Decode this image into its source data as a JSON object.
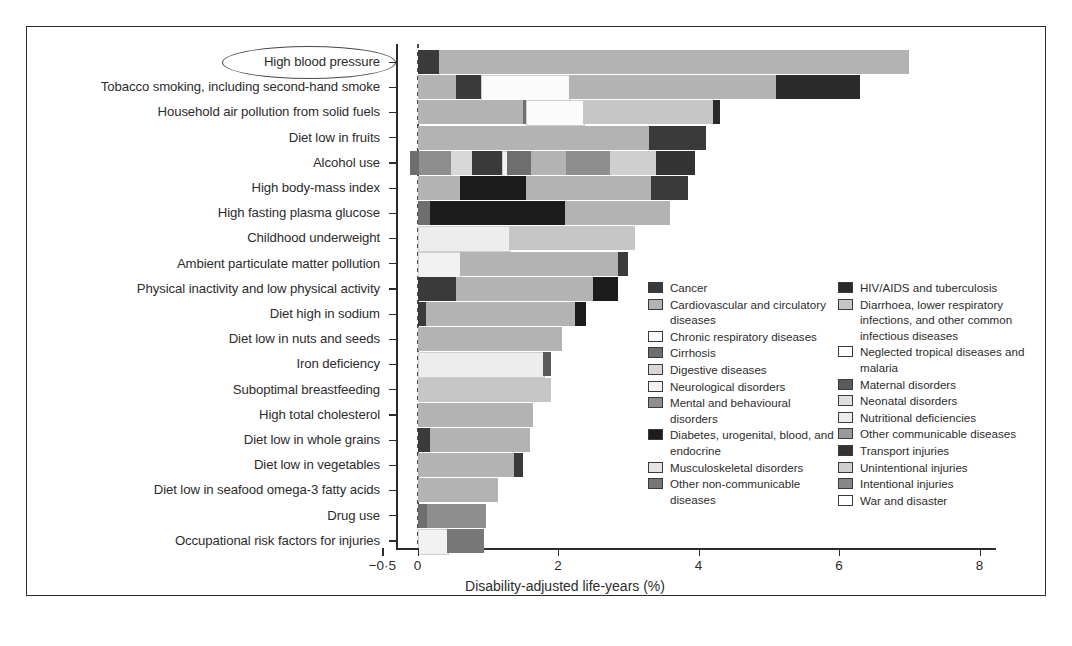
{
  "figure": {
    "xlabel": "Disability-adjusted life-years (%)",
    "x_ticks": [
      "−0·5",
      "0",
      "2",
      "4",
      "6",
      "8"
    ],
    "highlight": "High blood pressure"
  },
  "palette": {
    "cancer": "#3a3a3a",
    "cardiovascular": "#b3b3b3",
    "chronic_respiratory": "#fbfbfb",
    "cirrhosis": "#6e6e6e",
    "digestive": "#d8d8d8",
    "neurological": "#f2f2f2",
    "mental_behavioural": "#8e8e8e",
    "diabetes": "#1c1c1c",
    "musculoskeletal": "#e4e4e4",
    "other_noncommunicable": "#777777",
    "hiv_tb": "#2a2a2a",
    "diarrhoea": "#c6c6c6",
    "neglected_tropical": "#fdfdfd",
    "maternal": "#5a5a5a",
    "neonatal": "#e0e0e0",
    "nutritional": "#ededed",
    "other_communicable": "#9a9a9a",
    "transport": "#333333",
    "unintentional": "#cfcfcf",
    "intentional": "#878787",
    "war_disaster": "#ffffff"
  },
  "legend": {
    "left": [
      {
        "key": "cancer",
        "label": "Cancer"
      },
      {
        "key": "cardiovascular",
        "label": "Cardiovascular and circulatory diseases"
      },
      {
        "key": "chronic_respiratory",
        "label": "Chronic respiratory diseases"
      },
      {
        "key": "cirrhosis",
        "label": "Cirrhosis"
      },
      {
        "key": "digestive",
        "label": "Digestive diseases"
      },
      {
        "key": "neurological",
        "label": "Neurological disorders"
      },
      {
        "key": "mental_behavioural",
        "label": "Mental and behavioural disorders"
      },
      {
        "key": "diabetes",
        "label": "Diabetes, urogenital, blood, and endocrine"
      },
      {
        "key": "musculoskeletal",
        "label": "Musculoskeletal disorders"
      },
      {
        "key": "other_noncommunicable",
        "label": "Other non-communicable diseases"
      }
    ],
    "right": [
      {
        "key": "hiv_tb",
        "label": "HIV/AIDS and tuberculosis"
      },
      {
        "key": "diarrhoea",
        "label": "Diarrhoea, lower respiratory infections, and other common infectious diseases"
      },
      {
        "key": "neglected_tropical",
        "label": "Neglected tropical diseases and malaria"
      },
      {
        "key": "maternal",
        "label": "Maternal disorders"
      },
      {
        "key": "neonatal",
        "label": "Neonatal disorders"
      },
      {
        "key": "nutritional",
        "label": "Nutritional deficiencies"
      },
      {
        "key": "other_communicable",
        "label": "Other communicable diseases"
      },
      {
        "key": "transport",
        "label": "Transport injuries"
      },
      {
        "key": "unintentional",
        "label": "Unintentional injuries"
      },
      {
        "key": "intentional",
        "label": "Intentional injuries"
      },
      {
        "key": "war_disaster",
        "label": "War and disaster"
      }
    ]
  },
  "chart_data": {
    "type": "bar",
    "orientation": "horizontal",
    "stacked": true,
    "title": "",
    "xlabel": "Disability-adjusted life-years (%)",
    "ylabel": "",
    "xlim": [
      -0.5,
      8.5
    ],
    "xticks": [
      -0.5,
      0,
      2,
      4,
      6,
      8
    ],
    "grid": false,
    "legend_position": "inside-right",
    "categories": [
      "High blood pressure",
      "Tobacco smoking, including second-hand smoke",
      "Household air pollution from solid fuels",
      "Diet low in fruits",
      "Alcohol use",
      "High body-mass index",
      "High fasting plasma glucose",
      "Childhood underweight",
      "Ambient particulate matter pollution",
      "Physical inactivity and low physical activity",
      "Diet high in sodium",
      "Diet low in nuts and seeds",
      "Iron deficiency",
      "Suboptimal breastfeeding",
      "High total cholesterol",
      "Diet low in whole grains",
      "Diet low in vegetables",
      "Diet low in seafood omega-3 fatty acids",
      "Drug use",
      "Occupational risk factors for injuries"
    ],
    "totals": [
      7.0,
      6.3,
      4.3,
      4.1,
      3.95,
      3.85,
      3.6,
      3.1,
      3.0,
      2.85,
      2.4,
      2.05,
      1.9,
      1.9,
      1.65,
      1.6,
      1.5,
      1.15,
      0.98,
      0.95
    ],
    "bars": [
      {
        "category": "High blood pressure",
        "total": 7.0,
        "segments": [
          {
            "key": "cancer",
            "start": 0.0,
            "value": 0.3
          },
          {
            "key": "cardiovascular",
            "start": 0.3,
            "value": 6.7
          }
        ]
      },
      {
        "category": "Tobacco smoking, including second-hand smoke",
        "total": 6.3,
        "segments": [
          {
            "key": "cardiovascular",
            "start": 0.0,
            "value": 0.55
          },
          {
            "key": "cancer",
            "start": 0.55,
            "value": 0.35
          },
          {
            "key": "chronic_respiratory",
            "start": 0.9,
            "value": 1.25
          },
          {
            "key": "cardiovascular",
            "start": 2.15,
            "value": 2.95
          },
          {
            "key": "hiv_tb",
            "start": 5.1,
            "value": 1.2
          }
        ]
      },
      {
        "category": "Household air pollution from solid fuels",
        "total": 4.3,
        "segments": [
          {
            "key": "cardiovascular",
            "start": 0.0,
            "value": 1.5
          },
          {
            "key": "cirrhosis",
            "start": 1.5,
            "value": 0.05
          },
          {
            "key": "chronic_respiratory",
            "start": 1.55,
            "value": 0.8
          },
          {
            "key": "diarrhoea",
            "start": 2.35,
            "value": 1.85
          },
          {
            "key": "hiv_tb",
            "start": 4.2,
            "value": 0.1
          }
        ]
      },
      {
        "category": "Diet low in fruits",
        "total": 4.1,
        "segments": [
          {
            "key": "cardiovascular",
            "start": 0.0,
            "value": 3.3
          },
          {
            "key": "cancer",
            "start": 3.3,
            "value": 0.8
          }
        ]
      },
      {
        "category": "Alcohol use",
        "total": 3.95,
        "segments": [
          {
            "key": "cirrhosis",
            "start": -0.1,
            "value": 0.12
          },
          {
            "key": "mental_behavioural",
            "start": 0.02,
            "value": 0.45
          },
          {
            "key": "digestive",
            "start": 0.47,
            "value": 0.3
          },
          {
            "key": "cancer",
            "start": 0.77,
            "value": 0.43
          },
          {
            "key": "neurological",
            "start": 1.2,
            "value": 0.08
          },
          {
            "key": "cirrhosis",
            "start": 1.28,
            "value": 0.34
          },
          {
            "key": "cardiovascular",
            "start": 1.62,
            "value": 0.5
          },
          {
            "key": "mental_behavioural",
            "start": 2.12,
            "value": 0.62
          },
          {
            "key": "unintentional",
            "start": 2.74,
            "value": 0.66
          },
          {
            "key": "transport",
            "start": 3.4,
            "value": 0.55
          }
        ]
      },
      {
        "category": "High body-mass index",
        "total": 3.85,
        "segments": [
          {
            "key": "cardiovascular",
            "start": 0.0,
            "value": 0.6
          },
          {
            "key": "diabetes",
            "start": 0.6,
            "value": 0.95
          },
          {
            "key": "cardiovascular",
            "start": 1.55,
            "value": 1.78
          },
          {
            "key": "cancer",
            "start": 3.33,
            "value": 0.52
          }
        ]
      },
      {
        "category": "High fasting plasma glucose",
        "total": 3.6,
        "segments": [
          {
            "key": "cirrhosis",
            "start": 0.0,
            "value": 0.18
          },
          {
            "key": "diabetes",
            "start": 0.18,
            "value": 1.92
          },
          {
            "key": "cardiovascular",
            "start": 2.1,
            "value": 1.5
          }
        ]
      },
      {
        "category": "Childhood underweight",
        "total": 3.1,
        "segments": [
          {
            "key": "nutritional",
            "start": 0.0,
            "value": 1.3
          },
          {
            "key": "diarrhoea",
            "start": 1.3,
            "value": 1.8
          }
        ]
      },
      {
        "category": "Ambient particulate matter pollution",
        "total": 3.0,
        "segments": [
          {
            "key": "neurological",
            "start": 0.0,
            "value": 0.6
          },
          {
            "key": "cardiovascular",
            "start": 0.6,
            "value": 2.25
          },
          {
            "key": "cancer",
            "start": 2.85,
            "value": 0.15
          }
        ]
      },
      {
        "category": "Physical inactivity and low physical activity",
        "total": 2.85,
        "segments": [
          {
            "key": "cancer",
            "start": 0.0,
            "value": 0.55
          },
          {
            "key": "cardiovascular",
            "start": 0.55,
            "value": 1.95
          },
          {
            "key": "diabetes",
            "start": 2.5,
            "value": 0.35
          }
        ]
      },
      {
        "category": "Diet high in sodium",
        "total": 2.4,
        "segments": [
          {
            "key": "cancer",
            "start": 0.0,
            "value": 0.12
          },
          {
            "key": "cardiovascular",
            "start": 0.12,
            "value": 2.12
          },
          {
            "key": "diabetes",
            "start": 2.24,
            "value": 0.16
          }
        ]
      },
      {
        "category": "Diet low in nuts and seeds",
        "total": 2.05,
        "segments": [
          {
            "key": "cardiovascular",
            "start": 0.0,
            "value": 2.05
          }
        ]
      },
      {
        "category": "Iron deficiency",
        "total": 1.9,
        "segments": [
          {
            "key": "nutritional",
            "start": 0.0,
            "value": 1.78
          },
          {
            "key": "maternal",
            "start": 1.78,
            "value": 0.12
          }
        ]
      },
      {
        "category": "Suboptimal breastfeeding",
        "total": 1.9,
        "segments": [
          {
            "key": "diarrhoea",
            "start": 0.0,
            "value": 1.9
          }
        ]
      },
      {
        "category": "High total cholesterol",
        "total": 1.65,
        "segments": [
          {
            "key": "cardiovascular",
            "start": 0.0,
            "value": 1.65
          }
        ]
      },
      {
        "category": "Diet low in whole grains",
        "total": 1.6,
        "segments": [
          {
            "key": "cancer",
            "start": 0.0,
            "value": 0.18
          },
          {
            "key": "cardiovascular",
            "start": 0.18,
            "value": 1.42
          }
        ]
      },
      {
        "category": "Diet low in vegetables",
        "total": 1.5,
        "segments": [
          {
            "key": "cardiovascular",
            "start": 0.0,
            "value": 1.38
          },
          {
            "key": "cancer",
            "start": 1.38,
            "value": 0.12
          }
        ]
      },
      {
        "category": "Diet low in seafood omega-3 fatty acids",
        "total": 1.15,
        "segments": [
          {
            "key": "cardiovascular",
            "start": 0.0,
            "value": 1.15
          }
        ]
      },
      {
        "category": "Drug use",
        "total": 0.98,
        "segments": [
          {
            "key": "cirrhosis",
            "start": 0.0,
            "value": 0.13
          },
          {
            "key": "mental_behavioural",
            "start": 0.13,
            "value": 0.85
          }
        ]
      },
      {
        "category": "Occupational risk factors for injuries",
        "total": 0.95,
        "segments": [
          {
            "key": "neurological",
            "start": 0.0,
            "value": 0.42
          },
          {
            "key": "other_noncommunicable",
            "start": 0.42,
            "value": 0.53
          }
        ]
      }
    ]
  }
}
